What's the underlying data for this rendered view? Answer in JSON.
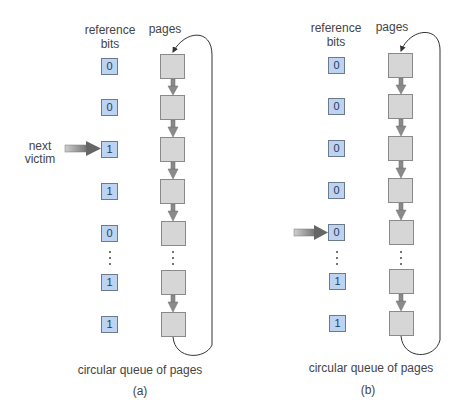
{
  "diagrams": [
    {
      "id": "a",
      "header_bits": "reference bits",
      "header_bits_line1": "reference",
      "header_bits_line2": "bits",
      "header_pages": "pages",
      "bits": [
        "0",
        "0",
        "1",
        "1",
        "0",
        "1",
        "1"
      ],
      "pointer_label_line1": "next",
      "pointer_label_line2": "victim",
      "pointer_index": 2,
      "queue_caption": "circular queue of pages",
      "sub_caption": "(a)"
    },
    {
      "id": "b",
      "header_bits_line1": "reference",
      "header_bits_line2": "bits",
      "header_pages": "pages",
      "bits": [
        "0",
        "0",
        "0",
        "0",
        "0",
        "1",
        "1"
      ],
      "pointer_index": 4,
      "queue_caption": "circular queue of pages",
      "sub_caption": "(b)"
    }
  ],
  "colors": {
    "bit_fill": "#bcd3f2",
    "page_fill": "#d6d6d6",
    "arrow": "#7a7a7a"
  }
}
